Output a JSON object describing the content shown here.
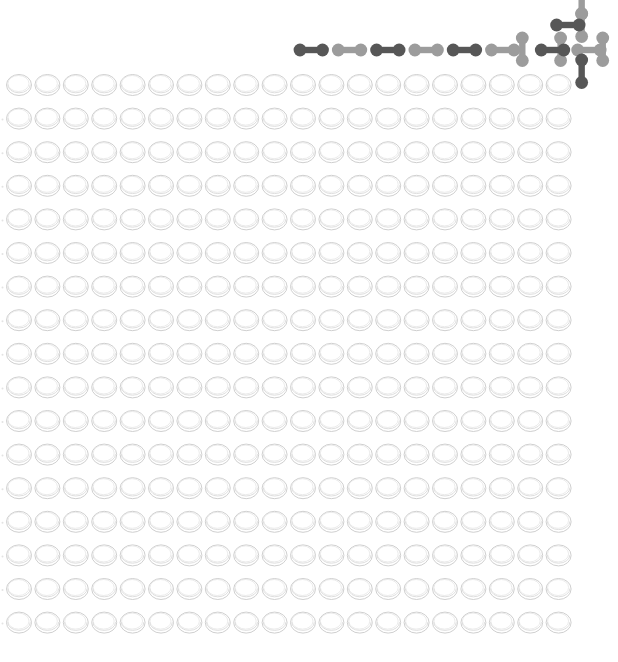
{
  "game": {
    "title": "Peg board with dumbbell pieces",
    "board": {
      "columns": 20,
      "rows": 17,
      "hole_state": "empty"
    },
    "colors": {
      "background": "#ffffff",
      "hole_outline": "#c9c9c9",
      "hole_rim": "#dadada",
      "piece_dark": "#575757",
      "piece_light": "#9c9c9c"
    },
    "pieces": [
      {
        "id": "p1",
        "shade": "dark",
        "orientation": "horizontal",
        "slot": [
          0,
          2
        ]
      },
      {
        "id": "p2",
        "shade": "light",
        "orientation": "horizontal",
        "slot": [
          1,
          2
        ]
      },
      {
        "id": "p3",
        "shade": "dark",
        "orientation": "horizontal",
        "slot": [
          2,
          2
        ]
      },
      {
        "id": "p4",
        "shade": "light",
        "orientation": "horizontal",
        "slot": [
          3,
          2
        ]
      },
      {
        "id": "p5",
        "shade": "dark",
        "orientation": "horizontal",
        "slot": [
          4,
          2
        ]
      },
      {
        "id": "p6",
        "shade": "light",
        "orientation": "horizontal",
        "slot": [
          5,
          2
        ]
      },
      {
        "id": "p7",
        "shade": "light",
        "orientation": "vertical",
        "slot": [
          6,
          2
        ]
      },
      {
        "id": "p8",
        "shade": "dark",
        "orientation": "horizontal",
        "slot": [
          6.3,
          2
        ]
      },
      {
        "id": "p9",
        "shade": "light",
        "orientation": "vertical",
        "slot": [
          7,
          2
        ]
      },
      {
        "id": "p10",
        "shade": "dark",
        "orientation": "horizontal",
        "slot": [
          6.7,
          1
        ]
      },
      {
        "id": "p11",
        "shade": "light",
        "orientation": "vertical",
        "slot": [
          7.55,
          1
        ]
      },
      {
        "id": "p12",
        "shade": "light",
        "orientation": "vertical",
        "slot": [
          7.55,
          0
        ]
      },
      {
        "id": "p13",
        "shade": "light",
        "orientation": "horizontal",
        "slot": [
          7.25,
          2
        ]
      },
      {
        "id": "p14",
        "shade": "light",
        "orientation": "vertical",
        "slot": [
          8.1,
          2
        ]
      },
      {
        "id": "p15",
        "shade": "dark",
        "orientation": "vertical",
        "slot": [
          7.55,
          3
        ]
      }
    ]
  }
}
